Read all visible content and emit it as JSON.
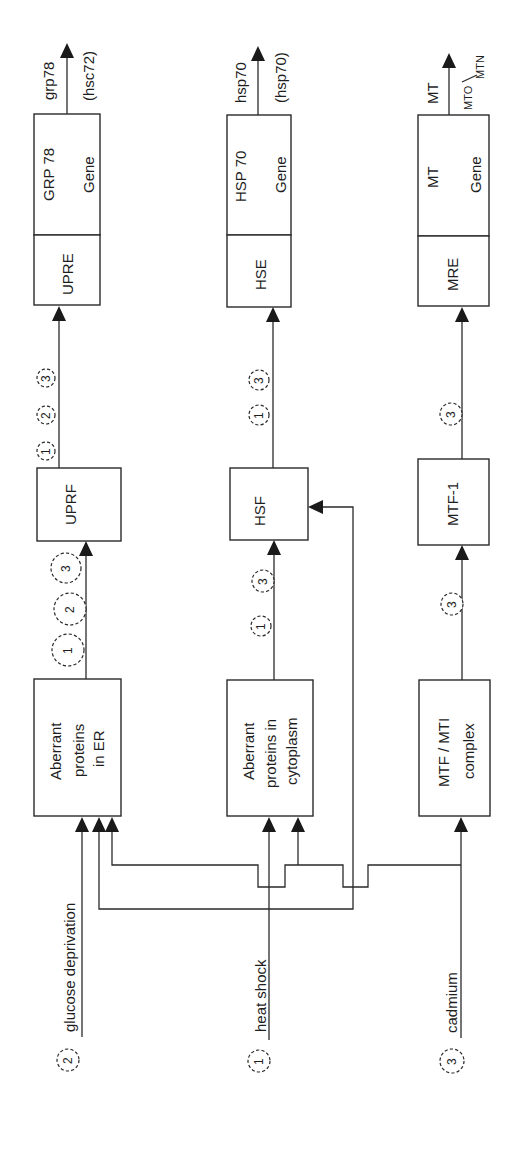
{
  "diagram": {
    "orientation": "rotated -90deg (reads bottom-to-top)",
    "stimuli": [
      {
        "id": "2",
        "label": "glucose deprivation"
      },
      {
        "id": "1",
        "label": "heat shock"
      },
      {
        "id": "3",
        "label": "cadmium"
      }
    ],
    "pathways": [
      {
        "sensor": {
          "lines": [
            "Aberrant",
            "proteins",
            "in ER"
          ]
        },
        "factor": "UPRF",
        "sensor_to_factor_badges": [
          "1",
          "2",
          "3"
        ],
        "factor_to_element_badges": [
          "1",
          "2",
          "3"
        ],
        "element": "UPRE",
        "gene": {
          "name": "GRP 78",
          "suffix": "Gene"
        },
        "product": {
          "main": "grp78",
          "alt": "(hsc72)"
        }
      },
      {
        "sensor": {
          "lines": [
            "Aberrant",
            "proteins in",
            "cytoplasm"
          ]
        },
        "factor": "HSF",
        "sensor_to_factor_badges": [
          "1",
          "3"
        ],
        "factor_to_element_badges": [
          "1",
          "3"
        ],
        "element": "HSE",
        "gene": {
          "name": "HSP 70",
          "suffix": "Gene"
        },
        "product": {
          "main": "hsp70",
          "alt": "(hsp70)"
        }
      },
      {
        "sensor": {
          "lines": [
            "MTF / MTI",
            "complex"
          ]
        },
        "factor": "MTF-1",
        "sensor_to_factor_badges": [
          "3"
        ],
        "factor_to_element_badges": [
          "3"
        ],
        "element": "MRE",
        "gene": {
          "name": "MT",
          "suffix": "Gene"
        },
        "product": {
          "main": "MT",
          "alt_main": "MTO",
          "alt_sub": "MTN"
        }
      }
    ],
    "connections": [
      {
        "from": "glucose deprivation",
        "to": "Aberrant proteins in ER"
      },
      {
        "from": "heat shock",
        "to": "Aberrant proteins in ER"
      },
      {
        "from": "heat shock",
        "to": "Aberrant proteins in cytoplasm"
      },
      {
        "from": "heat shock",
        "to": "HSF"
      },
      {
        "from": "cadmium",
        "to": "Aberrant proteins in ER"
      },
      {
        "from": "cadmium",
        "to": "Aberrant proteins in cytoplasm"
      },
      {
        "from": "cadmium",
        "to": "MTF / MTI complex"
      }
    ],
    "colors": {
      "stroke": "#2a2a2a",
      "background": "#ffffff"
    }
  }
}
